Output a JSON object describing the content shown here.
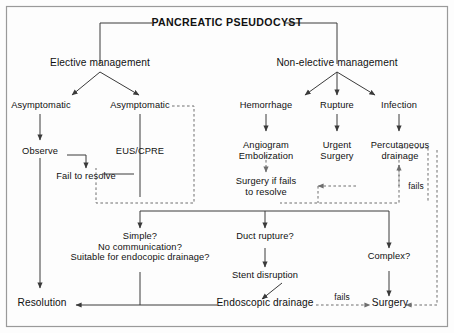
{
  "diagram": {
    "title": "PANCREATIC PSEUDOCYST",
    "border_color": "#9a9a9a",
    "line_color": "#3a3a3a",
    "text_color": "#111111",
    "background": "#fdfdfd",
    "nodes": {
      "root": "PANCREATIC PSEUDOCYST",
      "elective": "Elective management",
      "nonelective": "Non-elective management",
      "asymptomatic_left": "Asymptomatic",
      "asymptomatic_right": "Asymptomatic",
      "hemorrhage": "Hemorrhage",
      "rupture": "Rupture",
      "infection": "Infection",
      "observe": "Observe",
      "eus_cpre": "EUS/CPRE",
      "angiogram_l1": "Angiogram",
      "angiogram_l2": "Embolization",
      "urgent_l1": "Urgent",
      "urgent_l2": "Surgery",
      "percutaneous_l1": "Percutaneous",
      "percutaneous_l2": "drainage",
      "fail_to_resolve": "Fail to resolve",
      "surgery_if_fails_l1": "Surgery if fails",
      "surgery_if_fails_l2": "to resolve",
      "simple_l1": "Simple?",
      "simple_l2": "No communication?",
      "simple_l3": "Suitable for endocopic drainage?",
      "duct_rupture": "Duct rupture?",
      "stent_disruption": "Stent disruption",
      "complex": "Complex?",
      "resolution": "Resolution",
      "endoscopic_drainage": "Endoscopic drainage",
      "surgery": "Surgery"
    },
    "edge_labels": {
      "fails_right": "fails",
      "fails_bottom": "fails"
    }
  }
}
